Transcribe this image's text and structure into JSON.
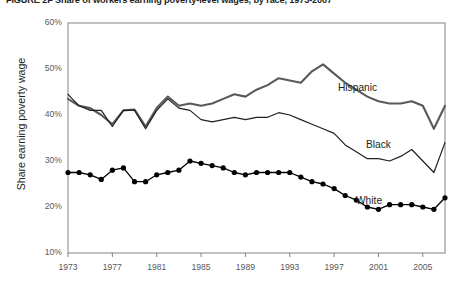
{
  "figure": {
    "title": "FIGURE 2F  Share of workers earning poverty-level wages, by race, 1973-2007"
  },
  "axis": {
    "y_title": "Share earning poverty wage",
    "y_ticks": [
      "60%",
      "50%",
      "40%",
      "30%",
      "20%",
      "10%"
    ],
    "x_ticks": [
      "1973",
      "1977",
      "1981",
      "1985",
      "1989",
      "1993",
      "1997",
      "2001",
      "2005"
    ]
  },
  "labels": {
    "hispanic": "Hispanic",
    "black": "Black",
    "white": "White"
  },
  "colors": {
    "hispanic": "#58595b",
    "black": "#231f20",
    "white": "#000000",
    "axis": "#808285",
    "tick_text": "#58595b"
  },
  "chart_data": {
    "type": "line",
    "title": "FIGURE 2F  Share of workers earning poverty-level wages, by race, 1973-2007",
    "xlabel": "",
    "ylabel": "Share earning poverty wage",
    "ylim": [
      10,
      60
    ],
    "xlim": [
      1973,
      2007
    ],
    "ytick_values": [
      60,
      50,
      40,
      30,
      20,
      10
    ],
    "xtick_values": [
      1973,
      1977,
      1981,
      1985,
      1989,
      1993,
      1997,
      2001,
      2005
    ],
    "grid": false,
    "legend": "inline-labels-right",
    "x": [
      1973,
      1974,
      1975,
      1976,
      1977,
      1978,
      1979,
      1980,
      1981,
      1982,
      1983,
      1984,
      1985,
      1986,
      1987,
      1988,
      1989,
      1990,
      1991,
      1992,
      1993,
      1994,
      1995,
      1996,
      1997,
      1998,
      1999,
      2000,
      2001,
      2002,
      2003,
      2004,
      2005,
      2006,
      2007
    ],
    "series": [
      {
        "name": "Hispanic",
        "marker": "none",
        "line_width": 2.1,
        "color": "#58595b",
        "values": [
          43.5,
          42.0,
          41.5,
          40.0,
          38.0,
          41.0,
          41.2,
          37.5,
          41.5,
          44.0,
          42.0,
          42.5,
          42.0,
          42.5,
          43.5,
          44.5,
          44.0,
          45.5,
          46.5,
          48.0,
          47.5,
          47.0,
          49.5,
          51.0,
          49.0,
          47.0,
          45.5,
          44.0,
          43.0,
          42.5,
          42.5,
          43.0,
          42.0,
          37.0,
          42.0
        ]
      },
      {
        "name": "Black",
        "marker": "none",
        "line_width": 1.2,
        "color": "#231f20",
        "values": [
          44.5,
          42.0,
          41.0,
          41.0,
          37.5,
          41.0,
          41.0,
          37.0,
          41.0,
          43.5,
          41.5,
          41.0,
          39.0,
          38.5,
          39.0,
          39.5,
          39.0,
          39.5,
          39.5,
          40.5,
          40.0,
          39.0,
          38.0,
          37.0,
          36.0,
          33.5,
          32.0,
          30.5,
          30.5,
          30.0,
          31.0,
          32.5,
          30.0,
          27.5,
          34.0
        ]
      },
      {
        "name": "White",
        "marker": "circle",
        "line_width": 1.3,
        "color": "#000000",
        "values": [
          27.5,
          27.5,
          27.0,
          26.0,
          28.0,
          28.5,
          25.5,
          25.5,
          27.0,
          27.5,
          28.0,
          30.0,
          29.5,
          29.0,
          28.5,
          27.5,
          27.0,
          27.5,
          27.5,
          27.5,
          27.5,
          26.5,
          25.5,
          25.0,
          24.0,
          22.5,
          21.5,
          20.0,
          19.5,
          20.5,
          20.5,
          20.5,
          20.0,
          19.5,
          22.0
        ]
      }
    ]
  }
}
